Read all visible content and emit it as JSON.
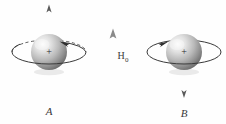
{
  "figure": {
    "background_color": "#fefefe",
    "ink_color": "#3a3a3a",
    "field_arrow_color": "#8c8c8c",
    "spin_axis_color": "#8a8a8a",
    "sphere_light": "#f2f2f2",
    "sphere_mid": "#b8b8b8",
    "sphere_dark": "#6e6e6e",
    "left": {
      "label": "A",
      "charge_symbol": "+",
      "spin_axis_arrow_direction": "up",
      "precession_direction": "counterclockwise",
      "orbit_back_line_style": "dashed",
      "orbit_front_line_style": "solid",
      "orbit_arrow_position": "upper-right",
      "orbit_arrow_points": "left"
    },
    "center": {
      "field_label": "H",
      "field_subscript": "0",
      "field_arrow_direction": "up"
    },
    "right": {
      "label": "B",
      "charge_symbol": "+",
      "spin_axis_arrow_direction": "down",
      "precession_direction": "clockwise",
      "orbit_back_line_style": "solid",
      "orbit_front_line_style": "solid",
      "orbit_arrow_position": "upper-left",
      "orbit_arrow_points": "right"
    }
  }
}
